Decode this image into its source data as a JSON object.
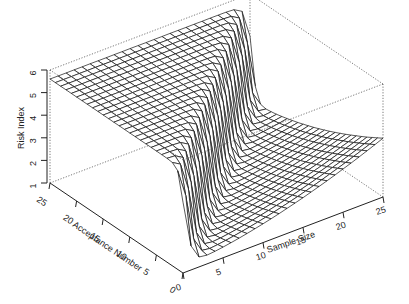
{
  "chart_data": {
    "type": "surface3d",
    "title": "",
    "xlabel": "Sample Size",
    "ylabel": "Acceptance Number",
    "zlabel": "Risk Index",
    "xlim": [
      0,
      25
    ],
    "ylim": [
      0,
      25
    ],
    "zlim": [
      1,
      6
    ],
    "x_ticks": [
      0,
      5,
      10,
      15,
      20,
      25
    ],
    "y_ticks": [
      0,
      5,
      10,
      15,
      20,
      25
    ],
    "z_ticks": [
      1,
      2,
      3,
      4,
      5,
      6
    ],
    "grid_steps": 25,
    "surface_description": "Plateau at ~5.6 where acceptance number >= sample size; steep cliff along the diagonal; low floor ~1.3 elsewhere rising toward ~3.6 at sample size 25, acceptance number 0",
    "plateau_value": 5.6,
    "floor_value": 1.3,
    "max_corner_value": 3.6,
    "box": true,
    "grid": false
  }
}
